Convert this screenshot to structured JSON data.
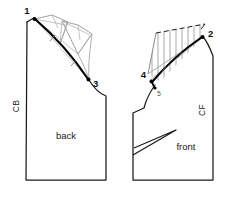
{
  "diagram": {
    "background_color": "#ffffff",
    "outline_color": "#1a1a1a",
    "construction_color": "#9a9a9a",
    "hatch_color": "#8c8c8c",
    "heavy_color": "#000000"
  },
  "pieces": [
    {
      "id": "back",
      "name_label": "back",
      "grain_label": "CB",
      "grain_label_meaning": "center-back",
      "point_labels": [
        "1",
        "3"
      ]
    },
    {
      "id": "front",
      "name_label": "front",
      "grain_label": "CF",
      "grain_label_meaning": "center-front",
      "point_labels": [
        "2",
        "4",
        "5"
      ]
    }
  ],
  "annotations": {
    "point_1": "1",
    "point_2": "2",
    "point_3": "3",
    "point_4": "4",
    "point_5": "5",
    "back_name": "back",
    "front_name": "front",
    "cb_grain": "CB",
    "cf_grain": "CF"
  }
}
